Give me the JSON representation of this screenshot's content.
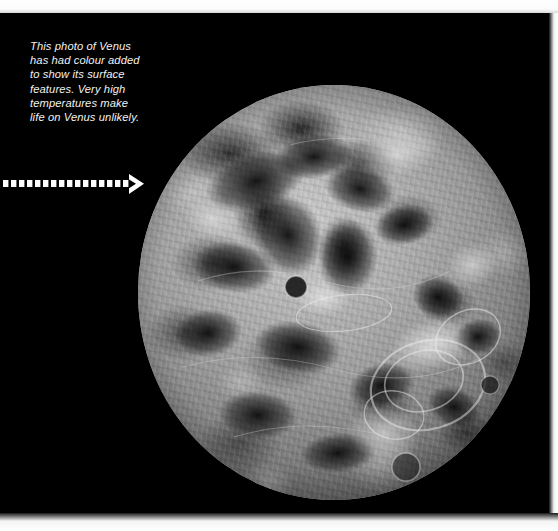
{
  "figure": {
    "kind": "photograph",
    "subject": "Venus",
    "background_color": "#000000",
    "caption": "This photo of Venus\nhas had colour added\nto show its surface\nfeatures. Very high\ntemperatures make\nlife on Venus unlikely.",
    "caption_color": "#f2f2f2",
    "pointer": {
      "name": "dotted-arrow",
      "direction": "right",
      "color": "#ffffff",
      "dash_count": 17
    },
    "planet": {
      "name": "venus-globe",
      "shape": "sphere",
      "surface": "radar-mapped terrain, greyscale with bright ridges and dark plains"
    }
  }
}
